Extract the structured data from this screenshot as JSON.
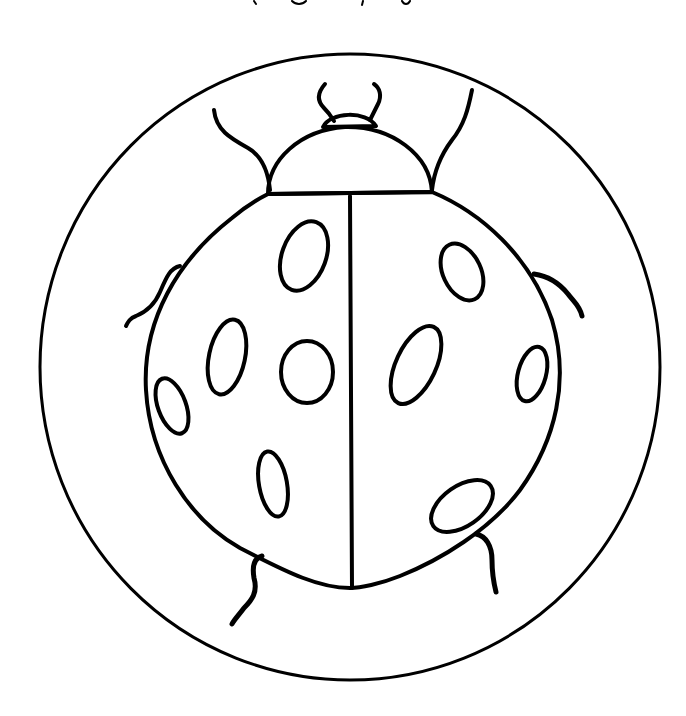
{
  "image": {
    "subject": "Ladybug coloring page",
    "style": "black line art on white",
    "colors": {
      "background": "#ffffff",
      "ink": "#000000"
    },
    "elements": [
      "circle-frame",
      "head",
      "antennae",
      "pronotum",
      "wing-divider",
      "spots",
      "legs"
    ],
    "spot_count": 11,
    "top_text_partial": ""
  }
}
